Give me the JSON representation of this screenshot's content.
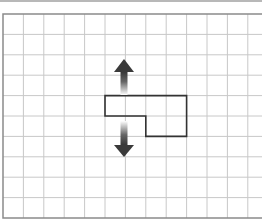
{
  "diagram": {
    "type": "grid-shape-translation",
    "grid": {
      "origin_x": 3,
      "origin_y": 14,
      "cell_size": 20.4,
      "columns": 13,
      "rows": 10,
      "line_color": "#c8c8c8",
      "border_color": "#8a8a8a"
    },
    "shape": {
      "description": "L-shaped polygon (rotated) spanning 4 columns, 2 rows",
      "vertices_cells": [
        [
          5,
          4
        ],
        [
          9,
          4
        ],
        [
          9,
          6
        ],
        [
          7,
          6
        ],
        [
          7,
          5
        ],
        [
          5,
          5
        ]
      ],
      "stroke": "#333333"
    },
    "arrows": [
      {
        "direction": "up",
        "label": "move-up",
        "color": "#333333"
      },
      {
        "direction": "down",
        "label": "move-down",
        "color": "#333333"
      }
    ]
  }
}
